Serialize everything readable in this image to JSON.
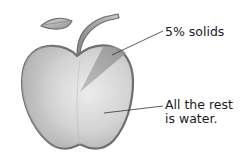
{
  "diagram": {
    "labels": {
      "solids": "5% solids",
      "water_line1": "All the rest",
      "water_line2": "is water."
    },
    "colors": {
      "outline": "#6e6e6e",
      "body_light": "#e2e2e2",
      "body_mid": "#c4c4c4",
      "body_dark": "#a8a8a8",
      "wedge": "#9a9a9a",
      "leader_line": "#333333",
      "text": "#1a1a1a"
    }
  }
}
